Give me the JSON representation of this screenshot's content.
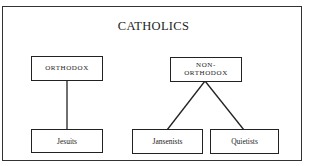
{
  "diagram": {
    "title": "CATHOLICS",
    "nodes": {
      "orthodox": {
        "label": "ORTHODOX"
      },
      "non_orthodox": {
        "label_line1": "NON-",
        "label_line2": "ORTHODOX"
      },
      "jesuits": {
        "label": "Jesuits"
      },
      "jansenists": {
        "label": "Jansenists"
      },
      "quietists": {
        "label": "Quietists"
      }
    },
    "edges": [
      {
        "from": "ORTHODOX",
        "to": "Jesuits"
      },
      {
        "from": "NON-ORTHODOX",
        "to": "Jansenists"
      },
      {
        "from": "NON-ORTHODOX",
        "to": "Quietists"
      }
    ]
  }
}
